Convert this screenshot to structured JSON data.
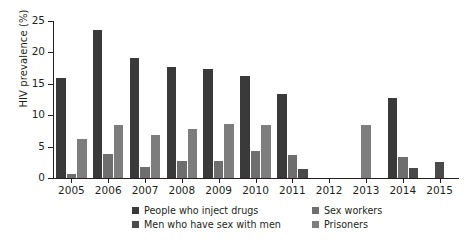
{
  "chart_data": {
    "type": "bar",
    "title": "",
    "subtitle": "",
    "xlabel": "",
    "ylabel": "HIV prevalence (%)",
    "ylim": [
      0,
      25
    ],
    "yticks": [
      0,
      5,
      10,
      15,
      20,
      25
    ],
    "ytick_labels": [
      "0",
      "5",
      "10",
      "15",
      "20",
      "25"
    ],
    "grid": false,
    "legend_position": "bottom",
    "categories": [
      "2005",
      "2006",
      "2007",
      "2008",
      "2009",
      "2010",
      "2011",
      "2012",
      "2013",
      "2014",
      "2015"
    ],
    "series": [
      {
        "name": "People who inject drugs",
        "color": "#3a3a3a",
        "values": [
          16.0,
          23.6,
          19.1,
          17.6,
          17.3,
          16.2,
          13.4,
          null,
          null,
          12.7,
          null
        ]
      },
      {
        "name": "Sex workers",
        "color": "#6e6e6e",
        "values": [
          0.7,
          3.8,
          1.7,
          2.7,
          2.7,
          4.3,
          3.7,
          null,
          null,
          3.4,
          null
        ]
      },
      {
        "name": "Men who have sex with men",
        "color": "#4a4a4a",
        "values": [
          null,
          null,
          null,
          null,
          null,
          null,
          1.4,
          null,
          null,
          1.6,
          2.6
        ]
      },
      {
        "name": "Prisoners",
        "color": "#7d7d7d",
        "values": [
          6.2,
          8.5,
          6.8,
          7.8,
          8.6,
          8.4,
          null,
          null,
          8.4,
          null,
          null
        ]
      }
    ]
  },
  "axis": {
    "y_title": "HIV prevalence (%)"
  },
  "legend": {
    "items": [
      {
        "label": "People who inject drugs",
        "color": "#3a3a3a"
      },
      {
        "label": "Sex workers",
        "color": "#6e6e6e"
      },
      {
        "label": "Men who have sex with men",
        "color": "#4a4a4a"
      },
      {
        "label": "Prisoners",
        "color": "#7d7d7d"
      }
    ]
  }
}
